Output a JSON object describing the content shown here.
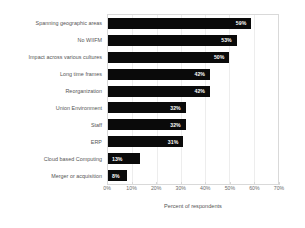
{
  "chart_data": {
    "type": "bar",
    "orientation": "horizontal",
    "title": "",
    "xlabel": "Percent of respondents",
    "ylabel": "",
    "xlim": [
      0,
      70
    ],
    "xticks": [
      "0%",
      "10%",
      "20%",
      "30%",
      "40%",
      "50%",
      "60%",
      "70%"
    ],
    "xtick_values": [
      0,
      10,
      20,
      30,
      40,
      50,
      60,
      70
    ],
    "grid": true,
    "legend": "none",
    "categories": [
      "Spanning geographic areas",
      "No WIIFM",
      "Impact across various cultures",
      "Long time frames",
      "Reorganization",
      "Union Environment",
      "Staff",
      "ERP",
      "Cloud based Computing",
      "Merger or acquisition"
    ],
    "values": [
      59,
      53,
      50,
      42,
      42,
      32,
      32,
      31,
      13,
      8
    ],
    "value_labels": [
      "59%",
      "53%",
      "50%",
      "42%",
      "42%",
      "32%",
      "32%",
      "31%",
      "13%",
      "8%"
    ],
    "bar_color": "#0a0a0a",
    "value_label_color": "#ffffff",
    "axis_text_color": "#6b6b6b",
    "grid_color": "#ededed",
    "plot_border_color": "#d9d9d9",
    "background_color": "#ffffff"
  }
}
